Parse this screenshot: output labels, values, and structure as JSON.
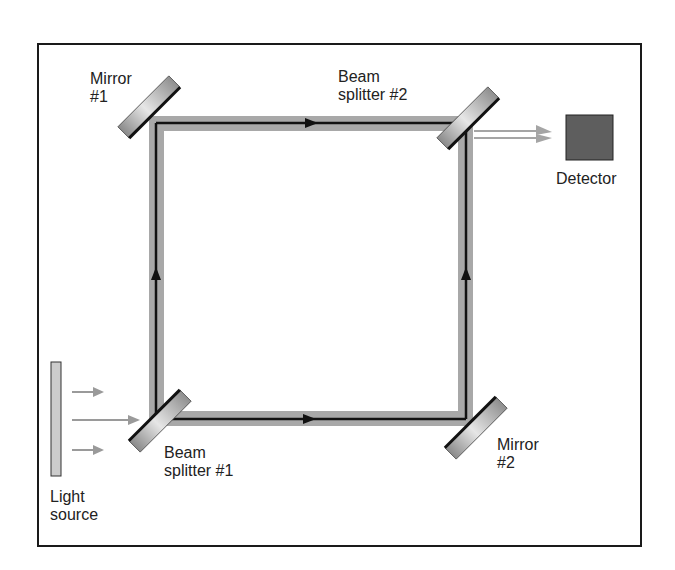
{
  "diagram": {
    "colors": {
      "frame": "#1a1a1a",
      "beam_band": "#a8a8a8",
      "beam_line": "#111111",
      "mirror_light": "#e0e0e0",
      "mirror_dark": "#7a7a7a",
      "mirror_edge": "#111111",
      "detector": "#5e5e5e",
      "source": "#cccccc",
      "arrow_gray": "#9a9a9a"
    },
    "labels": {
      "mirror1": "Mirror\n#1",
      "mirror2": "Mirror\n#2",
      "beam_splitter1": "Beam\nsplitter #1",
      "beam_splitter2": "Beam\nsplitter #2",
      "detector": "Detector",
      "light_source": "Light\nsource"
    },
    "components": [
      {
        "id": "light_source",
        "type": "source",
        "label": "Light source"
      },
      {
        "id": "beam_splitter1",
        "type": "beam-splitter",
        "label": "Beam splitter #1"
      },
      {
        "id": "mirror1",
        "type": "mirror",
        "label": "Mirror #1"
      },
      {
        "id": "mirror2",
        "type": "mirror",
        "label": "Mirror #2"
      },
      {
        "id": "beam_splitter2",
        "type": "beam-splitter",
        "label": "Beam splitter #2"
      },
      {
        "id": "detector",
        "type": "detector",
        "label": "Detector"
      }
    ],
    "paths": [
      {
        "from": "light_source",
        "to": "beam_splitter1",
        "direction": "right"
      },
      {
        "from": "beam_splitter1",
        "to": "mirror1",
        "direction": "up"
      },
      {
        "from": "mirror1",
        "to": "beam_splitter2",
        "direction": "right"
      },
      {
        "from": "beam_splitter1",
        "to": "mirror2",
        "direction": "right"
      },
      {
        "from": "mirror2",
        "to": "beam_splitter2",
        "direction": "up"
      },
      {
        "from": "beam_splitter2",
        "to": "detector",
        "direction": "right"
      }
    ]
  }
}
